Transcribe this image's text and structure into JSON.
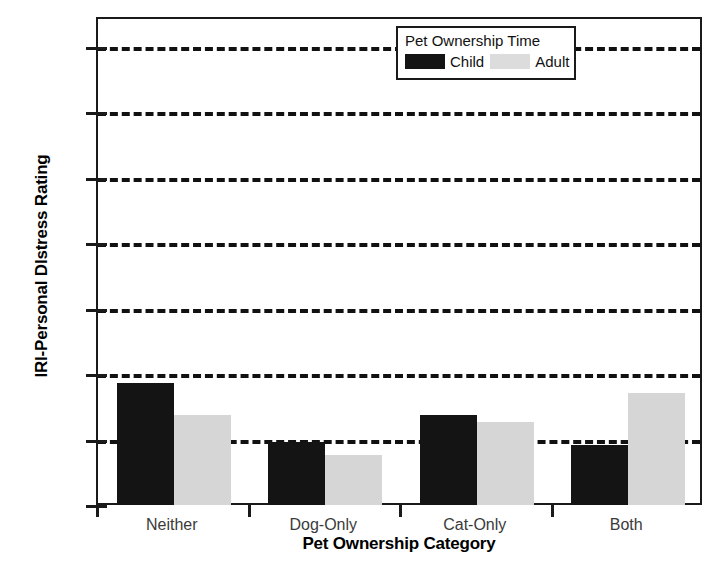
{
  "chart_data": {
    "type": "bar",
    "title": "",
    "xlabel": "Pet Ownership Category",
    "ylabel": "IRI-Personal DIstress Rating",
    "categories": [
      "Neither",
      "Dog-Only",
      "Cat-Only",
      "Both"
    ],
    "series": [
      {
        "name": "Child",
        "color": "#141414",
        "values": [
          2.88,
          2.7,
          2.78,
          2.69
        ]
      },
      {
        "name": "Adult",
        "color": "#d6d6d6",
        "values": [
          2.78,
          2.66,
          2.76,
          2.85
        ]
      }
    ],
    "ylim": [
      2.5,
      3.9
    ],
    "yticks": [
      2.5,
      2.7,
      2.9,
      3.1,
      3.3,
      3.5,
      3.7,
      3.9
    ],
    "ytick_labels": [
      "2.5",
      "2.7",
      "2.9",
      "3.1",
      "3.3",
      "3.5",
      "3.7",
      "3.9"
    ],
    "gridlines": [
      2.7,
      2.9,
      3.1,
      3.3,
      3.5,
      3.7,
      3.9
    ],
    "grid": true,
    "grid_style": "dashed",
    "legend": {
      "title": "Pet Ownership Time",
      "position": "top-right",
      "entries": [
        {
          "label": "Child",
          "color": "#141414"
        },
        {
          "label": "Adult",
          "color": "#dcdcdc"
        }
      ]
    },
    "frame_color": "#1a1a1a",
    "background": "#ffffff"
  }
}
